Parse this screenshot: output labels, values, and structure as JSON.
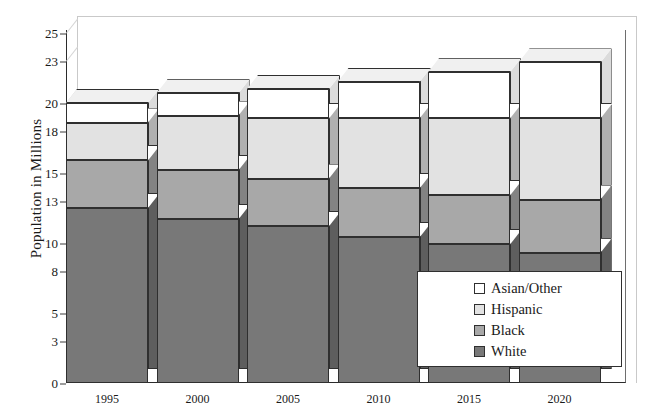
{
  "chart_data": {
    "type": "bar",
    "subtype": "stacked-3d-column",
    "title": "",
    "xlabel": "",
    "ylabel": "Population in Millions",
    "categories": [
      "1995",
      "2000",
      "2005",
      "2010",
      "2015",
      "2020"
    ],
    "series": [
      {
        "name": "White",
        "color": "#787878",
        "values": [
          12.5,
          11.7,
          11.2,
          10.4,
          9.9,
          9.3
        ]
      },
      {
        "name": "Black",
        "color": "#a8a8a8",
        "values": [
          3.4,
          3.5,
          3.4,
          3.5,
          3.5,
          3.8
        ]
      },
      {
        "name": "Hispanic",
        "color": "#e2e2e2",
        "values": [
          2.7,
          3.9,
          4.3,
          5.0,
          5.5,
          5.8
        ]
      },
      {
        "name": "Asian/Other",
        "color": "#ffffff",
        "values": [
          1.4,
          1.6,
          2.1,
          2.6,
          3.3,
          4.0
        ]
      }
    ],
    "totals": [
      20.0,
      20.7,
      21.0,
      21.5,
      22.2,
      22.9
    ],
    "yticks": [
      0,
      3,
      5,
      8,
      10,
      13,
      15,
      18,
      20,
      23,
      25
    ],
    "ylim": [
      0,
      25
    ],
    "grid": false,
    "legend_position": "bottom-right",
    "legend_entries": [
      "Asian/Other",
      "Hispanic",
      "Black",
      "White"
    ]
  },
  "legend": {
    "items": [
      {
        "label": "Asian/Other",
        "color": "#ffffff"
      },
      {
        "label": "Hispanic",
        "color": "#e2e2e2"
      },
      {
        "label": "Black",
        "color": "#a8a8a8"
      },
      {
        "label": "White",
        "color": "#787878"
      }
    ]
  },
  "axis": {
    "y_title": "Population in Millions",
    "y_ticks": [
      "25",
      "23",
      "20",
      "18",
      "15",
      "13",
      "10",
      "8",
      "5",
      "3",
      "0"
    ],
    "x_ticks": [
      "1995",
      "2000",
      "2005",
      "2010",
      "2015",
      "2020"
    ]
  }
}
